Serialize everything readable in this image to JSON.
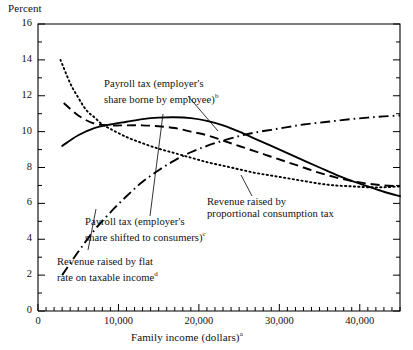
{
  "figure": {
    "ylabel": "Percent",
    "xlabel_text": "Family income (dollars)",
    "xlabel_note": "a"
  },
  "callouts": {
    "borne": {
      "line1": "Payroll tax (employer's",
      "line2": "share borne by employee)",
      "note": "b"
    },
    "shifted": {
      "line1": "Payroll tax (employer's",
      "line2": "share shifted to consumers)",
      "note": "c"
    },
    "flat": {
      "line1": "Revenue raised by flat",
      "line2": "rate on taxable income",
      "note": "d"
    },
    "consumption": {
      "line1": "Revenue raised by",
      "line2": "proportional consumption tax",
      "note": ""
    }
  },
  "chart_data": {
    "type": "line",
    "title": "",
    "xlabel": "Family income (dollars)",
    "ylabel": "Percent",
    "xlim": [
      0,
      45000
    ],
    "ylim": [
      0,
      16
    ],
    "grid": false,
    "legend": "inline-callouts",
    "x_major_ticks": [
      0,
      10000,
      20000,
      30000,
      40000
    ],
    "x_tick_labels": [
      "0",
      "10,000",
      "20,000",
      "30,000",
      "40,000"
    ],
    "x_minor_step": 1000,
    "y_major_ticks": [
      0,
      2,
      4,
      6,
      8,
      10,
      12,
      14,
      16
    ],
    "y_tick_labels": [
      "0",
      "2",
      "4",
      "6",
      "8",
      "10",
      "12",
      "14",
      "16"
    ],
    "y_minor_step": 1,
    "series": [
      {
        "name": "Payroll tax (employer's share borne by employee)",
        "style": "solid",
        "color": "#000000",
        "x": [
          3000,
          5000,
          7000,
          9000,
          11000,
          13000,
          15000,
          17000,
          19000,
          21000,
          23000,
          25000,
          27000,
          29000,
          31000,
          33000,
          35000,
          37000,
          39000,
          41000,
          43000,
          45000
        ],
        "y": [
          9.2,
          9.8,
          10.2,
          10.4,
          10.55,
          10.7,
          10.78,
          10.8,
          10.75,
          10.6,
          10.35,
          10.0,
          9.6,
          9.2,
          8.8,
          8.4,
          8.0,
          7.6,
          7.25,
          6.95,
          6.65,
          6.4
        ]
      },
      {
        "name": "Payroll tax (employer's share borne by employee) - dashed variant",
        "style": "dashed",
        "color": "#000000",
        "x": [
          3200,
          5000,
          7000,
          9000,
          11000,
          13000,
          15000,
          17000,
          19000,
          21000,
          23000,
          25000,
          27000,
          29000,
          31000,
          33000,
          35000,
          37000,
          39000,
          41000,
          43000,
          45000
        ],
        "y": [
          11.6,
          10.9,
          10.45,
          10.35,
          10.35,
          10.35,
          10.3,
          10.2,
          10.0,
          9.8,
          9.5,
          9.2,
          8.9,
          8.6,
          8.3,
          8.0,
          7.7,
          7.45,
          7.25,
          7.1,
          7.0,
          6.95
        ]
      },
      {
        "name": "Revenue raised by proportional consumption tax",
        "style": "dotted",
        "color": "#000000",
        "x": [
          2800,
          4000,
          5000,
          6000,
          7000,
          8000,
          9000,
          11000,
          13000,
          15000,
          17000,
          19000,
          21000,
          23000,
          25000,
          27000,
          29000,
          31000,
          33000,
          35000,
          37000,
          39000,
          41000,
          43000,
          45000
        ],
        "y": [
          14.0,
          12.7,
          11.9,
          11.2,
          10.8,
          10.4,
          10.15,
          9.7,
          9.35,
          9.05,
          8.8,
          8.55,
          8.3,
          8.1,
          7.9,
          7.7,
          7.55,
          7.4,
          7.25,
          7.1,
          7.0,
          6.95,
          6.9,
          6.9,
          6.95
        ]
      },
      {
        "name": "Revenue raised by flat rate on taxable income",
        "style": "dashdot",
        "color": "#000000",
        "x": [
          3000,
          5000,
          7000,
          9000,
          11000,
          13000,
          15000,
          17000,
          19000,
          21000,
          23000,
          25000,
          27000,
          29000,
          31000,
          33000,
          35000,
          37000,
          39000,
          41000,
          43000,
          45000
        ],
        "y": [
          2.0,
          3.3,
          4.5,
          5.5,
          6.4,
          7.2,
          7.85,
          8.4,
          8.85,
          9.2,
          9.5,
          9.75,
          9.95,
          10.1,
          10.25,
          10.4,
          10.5,
          10.6,
          10.7,
          10.78,
          10.85,
          10.9
        ]
      }
    ]
  }
}
